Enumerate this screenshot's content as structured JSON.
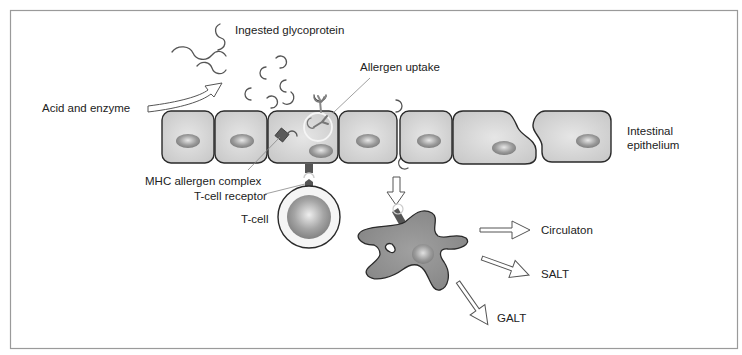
{
  "figure": {
    "frame_color": "#9a9a9a",
    "cell_fill": "#d4d4d4",
    "cell_stroke": "#2a2a2a",
    "nucleus_color": "#8c8c8c",
    "dendritic_cell_fill": "#8e8e8e"
  },
  "labels": {
    "ingested_glycoprotein": "Ingested glycoprotein",
    "acid_and_enzyme": "Acid and enzyme",
    "allergen_uptake": "Allergen uptake",
    "intestinal_epithelium_line1": "Intestinal",
    "intestinal_epithelium_line2": "epithelium",
    "mhc_allergen_complex": "MHC allergen complex",
    "t_cell_receptor": "T-cell receptor",
    "t_cell": "T-cell",
    "circulation": "Circulaton",
    "salt": "SALT",
    "galt": "GALT"
  }
}
